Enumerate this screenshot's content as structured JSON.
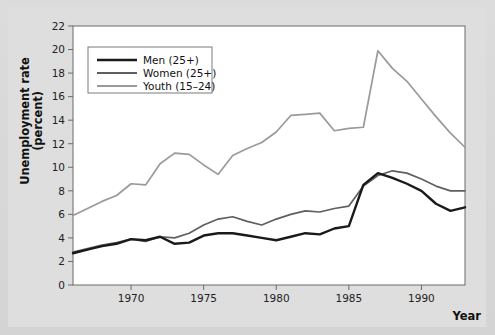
{
  "figure": {
    "background_color": "#dedede",
    "plot_background_color": "#ffffff"
  },
  "axis": {
    "ylabel_line1": "Unemployment rate",
    "ylabel_line2": "(percent)",
    "xlabel": "Year",
    "y_ticks": [
      "0",
      "2",
      "4",
      "6",
      "8",
      "10",
      "12",
      "14",
      "16",
      "18",
      "20",
      "22"
    ],
    "x_ticks": [
      "1970",
      "1975",
      "1980",
      "1985",
      "1990"
    ]
  },
  "legend": {
    "entries": [
      {
        "label": "Men (25+)",
        "color": "#1a1a1a"
      },
      {
        "label": "Women (25+)",
        "color": "#5f5f5f"
      },
      {
        "label": "Youth (15–24)",
        "color": "#9a9a9a"
      }
    ]
  },
  "chart_data": {
    "type": "line",
    "title": "",
    "xlabel": "Year",
    "ylabel": "Unemployment rate (percent)",
    "xlim": [
      1966,
      1993
    ],
    "ylim": [
      0,
      22
    ],
    "y_tick_step": 2,
    "x_tick_values": [
      1970,
      1975,
      1980,
      1985,
      1990
    ],
    "grid": false,
    "legend_position": "upper-left-inside",
    "x": [
      1966,
      1967,
      1968,
      1969,
      1970,
      1971,
      1972,
      1973,
      1974,
      1975,
      1976,
      1977,
      1978,
      1979,
      1980,
      1981,
      1982,
      1983,
      1984,
      1985,
      1986,
      1987,
      1988,
      1989,
      1990,
      1991,
      1992,
      1993
    ],
    "series": [
      {
        "name": "Men (25+)",
        "color": "#1a1a1a",
        "width": 2.4,
        "values": [
          2.7,
          3.0,
          3.3,
          3.5,
          3.9,
          3.8,
          4.1,
          3.5,
          3.6,
          4.2,
          4.4,
          4.4,
          4.2,
          4.0,
          3.8,
          4.1,
          4.4,
          4.3,
          4.8,
          5.0,
          8.5,
          9.5,
          9.1,
          8.6,
          8.0,
          6.9,
          6.3,
          6.6
        ]
      },
      {
        "name": "Women (25+)",
        "color": "#5f5f5f",
        "width": 1.7,
        "values": [
          2.8,
          3.1,
          3.4,
          3.6,
          3.9,
          3.7,
          4.1,
          4.0,
          4.4,
          5.1,
          5.6,
          5.8,
          5.4,
          5.1,
          5.6,
          6.0,
          6.3,
          6.2,
          6.5,
          6.7,
          8.4,
          9.3,
          9.7,
          9.5,
          9.0,
          8.4,
          8.0,
          8.0
        ]
      },
      {
        "name": "Youth (15–24)",
        "color": "#9a9a9a",
        "width": 1.7,
        "values": [
          5.9,
          6.5,
          7.1,
          7.6,
          8.6,
          8.5,
          10.3,
          11.2,
          11.1,
          10.2,
          9.4,
          11.0,
          11.6,
          12.1,
          13.0,
          14.4,
          14.5,
          14.6,
          13.1,
          13.3,
          13.4,
          19.9,
          18.4,
          17.3,
          15.8,
          14.3,
          12.9,
          11.7
        ]
      }
    ],
    "note": "Youth series peaks near 19.9 around 1983; Men and Women converge near 2.7-2.8 at 1966."
  }
}
